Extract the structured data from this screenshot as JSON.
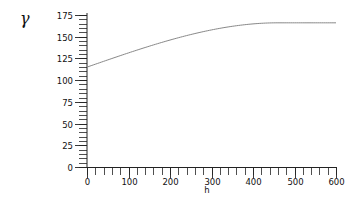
{
  "chart_data": {
    "type": "line",
    "title": "",
    "xlabel": "h",
    "ylabel": "γ",
    "xlim": [
      0,
      600
    ],
    "ylim": [
      0,
      175
    ],
    "grid": false,
    "legend": null,
    "x_ticks": [
      0,
      100,
      200,
      300,
      400,
      500,
      600
    ],
    "x_tick_labels": [
      "0",
      "100",
      "200",
      "300",
      "400",
      "500",
      "600"
    ],
    "x_minor_step": 20,
    "y_ticks": [
      0,
      25,
      50,
      75,
      100,
      125,
      150,
      175
    ],
    "y_tick_labels": [
      "0",
      "25",
      "50",
      "75",
      "100",
      "125",
      "150",
      "175"
    ],
    "y_minor_step": 5,
    "model": {
      "name": "spherical variogram",
      "nugget": 115,
      "sill": 166,
      "range": 460
    },
    "series": [
      {
        "name": "variogram",
        "color": "#888888",
        "x": [
          0,
          50,
          100,
          150,
          200,
          250,
          300,
          350,
          400,
          450,
          460,
          500,
          550,
          600
        ],
        "y": [
          115,
          123.3,
          131.4,
          139.1,
          146.1,
          152.3,
          157.4,
          161.4,
          164.4,
          165.9,
          166,
          166,
          166,
          166
        ]
      }
    ]
  }
}
